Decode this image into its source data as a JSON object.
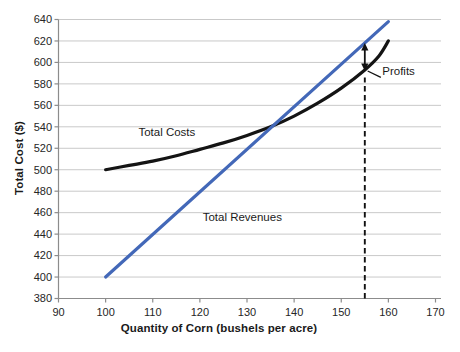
{
  "chart_data": {
    "type": "line",
    "title": "",
    "xlabel": "Quantity of Corn (bushels per acre)",
    "ylabel": "Total Cost ($)",
    "xlim": [
      90,
      170
    ],
    "ylim": [
      380,
      640
    ],
    "xtick_step": 10,
    "ytick_step": 20,
    "grid": "horizontal",
    "legend_position": "inline-labels",
    "colors": {
      "total_costs": "#141414",
      "total_revenues": "#4368b8",
      "gridline": "#c9c9c9",
      "axis": "#8c8c8c",
      "tick_text": "#262626",
      "annotation": "#111111"
    },
    "series": [
      {
        "name": "Total Costs",
        "color": "#141414",
        "width": 3.2,
        "smooth": true,
        "points": [
          [
            100,
            500
          ],
          [
            105,
            504
          ],
          [
            110,
            508
          ],
          [
            115,
            513
          ],
          [
            120,
            519
          ],
          [
            125,
            525
          ],
          [
            130,
            532
          ],
          [
            135,
            540
          ],
          [
            140,
            550
          ],
          [
            145,
            562
          ],
          [
            150,
            576
          ],
          [
            155,
            593
          ],
          [
            158,
            606
          ],
          [
            160,
            620
          ]
        ],
        "label_at": [
          113,
          531
        ],
        "label_anchor": "middle"
      },
      {
        "name": "Total Revenues",
        "color": "#4368b8",
        "width": 3.2,
        "smooth": false,
        "points": [
          [
            100,
            400
          ],
          [
            160,
            638
          ]
        ],
        "label_at": [
          129,
          452
        ],
        "label_anchor": "middle"
      }
    ],
    "annotations": {
      "profit_max_quantity": 155,
      "dashed_line": {
        "x": 155,
        "from": 380,
        "to": 586
      },
      "profits_arrow": {
        "x": 155,
        "from": 592,
        "to": 618
      },
      "pointer_line": {
        "from": [
          155.6,
          592
        ],
        "to": [
          158.4,
          586
        ]
      },
      "profits_label": {
        "text": "Profits",
        "at": [
          158.7,
          588
        ]
      }
    }
  }
}
